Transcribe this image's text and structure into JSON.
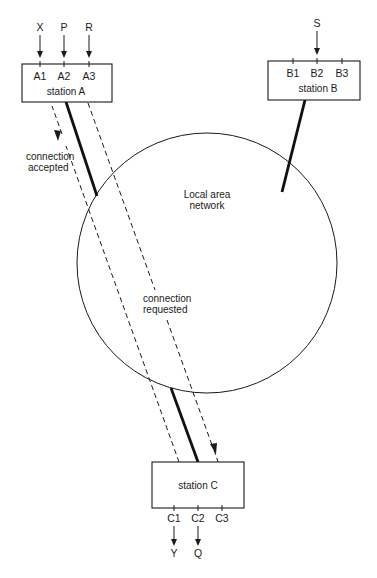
{
  "diagram": {
    "network_label": [
      "Local area",
      "network"
    ],
    "stations": [
      {
        "id": "A",
        "label": "station A",
        "ports": [
          "A1",
          "A2",
          "A3"
        ],
        "inputs": [
          "X",
          "P",
          "R"
        ],
        "outputs": []
      },
      {
        "id": "B",
        "label": "station B",
        "ports": [
          "B1",
          "B2",
          "B3"
        ],
        "inputs": [
          "",
          "S",
          ""
        ],
        "outputs": []
      },
      {
        "id": "C",
        "label": "station C",
        "ports": [
          "C1",
          "C2",
          "C3"
        ],
        "inputs": [],
        "outputs": [
          "Y",
          "Q",
          ""
        ]
      }
    ],
    "messages": [
      {
        "label": [
          "connection",
          "accepted"
        ],
        "from": "C",
        "to": "A"
      },
      {
        "label": [
          "connection",
          "requested"
        ],
        "from": "A",
        "to": "C"
      }
    ],
    "links": [
      {
        "from": "A",
        "to": "network"
      },
      {
        "from": "B",
        "to": "network"
      },
      {
        "from": "C",
        "to": "network"
      }
    ]
  }
}
